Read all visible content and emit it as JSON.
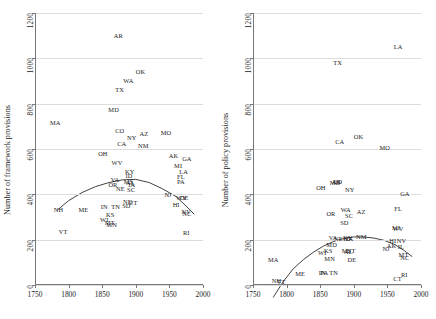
{
  "figure": {
    "background": "#ffffff",
    "grid_color": "#dcdcdc",
    "axis_color": "#777777",
    "curve_color": "#2b2b2b",
    "label_color": "#1a1a1a"
  },
  "chart_data": [
    {
      "type": "scatter",
      "panel": "left",
      "title": "",
      "xlabel": "",
      "ylabel": "Number of framework provisions",
      "xlim": [
        1750,
        2000
      ],
      "ylim": [
        0,
        1200
      ],
      "xticks": [
        1750,
        1800,
        1850,
        1900,
        1950,
        2000
      ],
      "yticks": [
        0,
        200,
        400,
        600,
        800,
        1000,
        1200
      ],
      "grid": "horizontal",
      "legend": "none",
      "point_labels": "state abbreviation",
      "points": [
        {
          "label": "AR",
          "x": 1874,
          "y": 1100
        },
        {
          "label": "OK",
          "x": 1907,
          "y": 940
        },
        {
          "label": "WA",
          "x": 1889,
          "y": 900
        },
        {
          "label": "TX",
          "x": 1876,
          "y": 860
        },
        {
          "label": "MD",
          "x": 1867,
          "y": 770
        },
        {
          "label": "MA",
          "x": 1780,
          "y": 715
        },
        {
          "label": "CO",
          "x": 1876,
          "y": 680
        },
        {
          "label": "MO",
          "x": 1945,
          "y": 672
        },
        {
          "label": "AZ",
          "x": 1912,
          "y": 665
        },
        {
          "label": "NY",
          "x": 1894,
          "y": 650
        },
        {
          "label": "CA",
          "x": 1879,
          "y": 620
        },
        {
          "label": "NM",
          "x": 1911,
          "y": 612
        },
        {
          "label": "OH",
          "x": 1851,
          "y": 578
        },
        {
          "label": "AK",
          "x": 1956,
          "y": 570
        },
        {
          "label": "GA",
          "x": 1976,
          "y": 555
        },
        {
          "label": "WV",
          "x": 1872,
          "y": 540
        },
        {
          "label": "MI",
          "x": 1963,
          "y": 527
        },
        {
          "label": "LA",
          "x": 1971,
          "y": 500
        },
        {
          "label": "KY",
          "x": 1891,
          "y": 498
        },
        {
          "label": "FL",
          "x": 1967,
          "y": 477
        },
        {
          "label": "ID",
          "x": 1890,
          "y": 480
        },
        {
          "label": "PA",
          "x": 1967,
          "y": 455
        },
        {
          "label": "VA",
          "x": 1869,
          "y": 462
        },
        {
          "label": "MS",
          "x": 1889,
          "y": 455
        },
        {
          "label": "AL",
          "x": 1892,
          "y": 450
        },
        {
          "label": "OR",
          "x": 1866,
          "y": 443
        },
        {
          "label": "IA",
          "x": 1894,
          "y": 443
        },
        {
          "label": "NE",
          "x": 1877,
          "y": 425
        },
        {
          "label": "SC",
          "x": 1893,
          "y": 420
        },
        {
          "label": "NJ",
          "x": 1948,
          "y": 396
        },
        {
          "label": "WY",
          "x": 1968,
          "y": 385
        },
        {
          "label": "DE",
          "x": 1972,
          "y": 382
        },
        {
          "label": "ND",
          "x": 1888,
          "y": 368
        },
        {
          "label": "UT",
          "x": 1896,
          "y": 362
        },
        {
          "label": "HI",
          "x": 1960,
          "y": 355
        },
        {
          "label": "SD",
          "x": 1886,
          "y": 348
        },
        {
          "label": "IN",
          "x": 1853,
          "y": 345
        },
        {
          "label": "TN",
          "x": 1870,
          "y": 345
        },
        {
          "label": "NH",
          "x": 1785,
          "y": 333
        },
        {
          "label": "ME",
          "x": 1822,
          "y": 330
        },
        {
          "label": "NV",
          "x": 1975,
          "y": 322
        },
        {
          "label": "NC",
          "x": 1976,
          "y": 312
        },
        {
          "label": "KS",
          "x": 1862,
          "y": 310
        },
        {
          "label": "WI",
          "x": 1853,
          "y": 288
        },
        {
          "label": "MT",
          "x": 1861,
          "y": 272
        },
        {
          "label": "MN",
          "x": 1864,
          "y": 265
        },
        {
          "label": "VT",
          "x": 1792,
          "y": 232
        },
        {
          "label": "RI",
          "x": 1975,
          "y": 230
        }
      ],
      "fit_curve": {
        "description": "fitted quadratic trend",
        "points": [
          {
            "x": 1783,
            "y": 330
          },
          {
            "x": 1800,
            "y": 372
          },
          {
            "x": 1820,
            "y": 408
          },
          {
            "x": 1840,
            "y": 434
          },
          {
            "x": 1860,
            "y": 452
          },
          {
            "x": 1880,
            "y": 464
          },
          {
            "x": 1900,
            "y": 466
          },
          {
            "x": 1920,
            "y": 452
          },
          {
            "x": 1940,
            "y": 424
          },
          {
            "x": 1960,
            "y": 390
          },
          {
            "x": 1975,
            "y": 348
          },
          {
            "x": 1987,
            "y": 312
          }
        ]
      }
    },
    {
      "type": "scatter",
      "panel": "right",
      "title": "",
      "xlabel": "",
      "ylabel": "Number of policy provisions",
      "xlim": [
        1750,
        2000
      ],
      "ylim": [
        0,
        1200
      ],
      "xticks": [
        1750,
        1800,
        1850,
        1900,
        1950,
        2000
      ],
      "yticks": [
        0,
        200,
        400,
        600,
        800,
        1000,
        1200
      ],
      "grid": "horizontal",
      "legend": "none",
      "point_labels": "state abbreviation",
      "points": [
        {
          "label": "LA",
          "x": 1966,
          "y": 1048
        },
        {
          "label": "TX",
          "x": 1876,
          "y": 980
        },
        {
          "label": "OK",
          "x": 1907,
          "y": 653
        },
        {
          "label": "CA",
          "x": 1879,
          "y": 632
        },
        {
          "label": "MO",
          "x": 1946,
          "y": 604
        },
        {
          "label": "CO",
          "x": 1876,
          "y": 455
        },
        {
          "label": "AR",
          "x": 1874,
          "y": 453
        },
        {
          "label": "MD",
          "x": 1872,
          "y": 450
        },
        {
          "label": "OH",
          "x": 1851,
          "y": 430
        },
        {
          "label": "NY",
          "x": 1894,
          "y": 420
        },
        {
          "label": "GA",
          "x": 1976,
          "y": 400
        },
        {
          "label": "FL",
          "x": 1966,
          "y": 335
        },
        {
          "label": "WA",
          "x": 1888,
          "y": 330
        },
        {
          "label": "AZ",
          "x": 1911,
          "y": 322
        },
        {
          "label": "OR",
          "x": 1866,
          "y": 315
        },
        {
          "label": "SC",
          "x": 1893,
          "y": 305
        },
        {
          "label": "SD",
          "x": 1886,
          "y": 275
        },
        {
          "label": "MI",
          "x": 1963,
          "y": 252
        },
        {
          "label": "WV",
          "x": 1966,
          "y": 248
        },
        {
          "label": "NM",
          "x": 1911,
          "y": 213
        },
        {
          "label": "VA",
          "x": 1869,
          "y": 208
        },
        {
          "label": "KY",
          "x": 1891,
          "y": 207
        },
        {
          "label": "NE",
          "x": 1877,
          "y": 205
        },
        {
          "label": "ID",
          "x": 1890,
          "y": 205
        },
        {
          "label": "IA",
          "x": 1894,
          "y": 203
        },
        {
          "label": "HI",
          "x": 1958,
          "y": 192
        },
        {
          "label": "NV",
          "x": 1971,
          "y": 193
        },
        {
          "label": "MD",
          "x": 1867,
          "y": 178
        },
        {
          "label": "AK",
          "x": 1956,
          "y": 172
        },
        {
          "label": "IL",
          "x": 1970,
          "y": 168
        },
        {
          "label": "NJ",
          "x": 1948,
          "y": 160
        },
        {
          "label": "MS",
          "x": 1889,
          "y": 148
        },
        {
          "label": "AL",
          "x": 1892,
          "y": 145
        },
        {
          "label": "UT",
          "x": 1896,
          "y": 148
        },
        {
          "label": "MT",
          "x": 1974,
          "y": 133
        },
        {
          "label": "NC",
          "x": 1976,
          "y": 120
        },
        {
          "label": "WI",
          "x": 1853,
          "y": 140
        },
        {
          "label": "KS",
          "x": 1862,
          "y": 148
        },
        {
          "label": "MN",
          "x": 1864,
          "y": 115
        },
        {
          "label": "DE",
          "x": 1897,
          "y": 112
        },
        {
          "label": "MA",
          "x": 1780,
          "y": 110
        },
        {
          "label": "IN",
          "x": 1853,
          "y": 55
        },
        {
          "label": "PA",
          "x": 1856,
          "y": 55
        },
        {
          "label": "TN",
          "x": 1870,
          "y": 52
        },
        {
          "label": "ME",
          "x": 1820,
          "y": 48
        },
        {
          "label": "RI",
          "x": 1975,
          "y": 45
        },
        {
          "label": "CT",
          "x": 1965,
          "y": 25
        },
        {
          "label": "NH",
          "x": 1785,
          "y": 18
        },
        {
          "label": "VT",
          "x": 1792,
          "y": 15
        }
      ],
      "fit_curve": {
        "description": "fitted quadratic trend",
        "points": [
          {
            "x": 1780,
            "y": -55
          },
          {
            "x": 1795,
            "y": 15
          },
          {
            "x": 1810,
            "y": 72
          },
          {
            "x": 1825,
            "y": 112
          },
          {
            "x": 1840,
            "y": 145
          },
          {
            "x": 1855,
            "y": 172
          },
          {
            "x": 1870,
            "y": 192
          },
          {
            "x": 1885,
            "y": 205
          },
          {
            "x": 1900,
            "y": 212
          },
          {
            "x": 1915,
            "y": 212
          },
          {
            "x": 1930,
            "y": 207
          },
          {
            "x": 1945,
            "y": 197
          },
          {
            "x": 1960,
            "y": 180
          },
          {
            "x": 1975,
            "y": 152
          },
          {
            "x": 1987,
            "y": 125
          }
        ]
      }
    }
  ]
}
